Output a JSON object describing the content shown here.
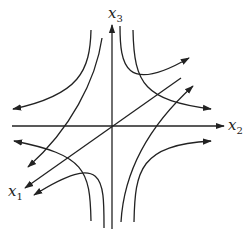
{
  "diagram": {
    "axes": {
      "x1": {
        "label": "x",
        "subscript": "1"
      },
      "x2": {
        "label": "x",
        "subscript": "2"
      },
      "x3": {
        "label": "x",
        "subscript": "3"
      }
    },
    "colors": {
      "stroke": "#222222",
      "background": "#ffffff"
    }
  }
}
